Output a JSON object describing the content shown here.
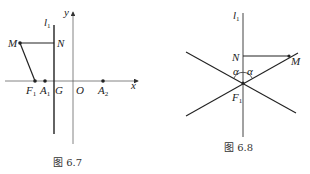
{
  "figures": [
    {
      "caption": "图 6.7",
      "labels": {
        "y": "y",
        "x": "x",
        "l1": "l",
        "l1_sub": "1",
        "M": "M",
        "N": "N",
        "F1": "F",
        "F1_sub": "1",
        "A1": "A",
        "A1_sub": "1",
        "G": "G",
        "O": "O",
        "A2": "A",
        "A2_sub": "2"
      }
    },
    {
      "caption": "图 6.8",
      "labels": {
        "l1": "l",
        "l1_sub": "1",
        "N": "N",
        "M": "M",
        "alpha_left": "α",
        "alpha_right": "α",
        "F1": "F",
        "F1_sub": "1"
      }
    }
  ],
  "colors": {
    "line": "#222222",
    "axis": "#555555",
    "text": "#222222"
  }
}
